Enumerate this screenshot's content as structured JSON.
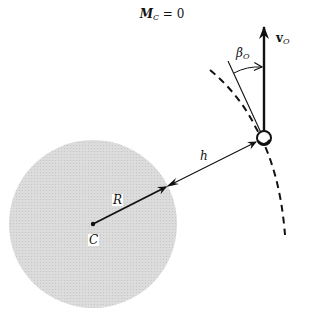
{
  "title": {
    "moment_symbol": "M",
    "moment_subscript": "C",
    "equation_rest": " = 0"
  },
  "labels": {
    "center": "C",
    "radius": "R",
    "altitude": "h",
    "velocity_symbol": "v",
    "velocity_subscript": "O",
    "angle_symbol": "β",
    "angle_subscript": "O"
  },
  "elements": {
    "planet": {
      "shape": "circle",
      "fill": "#d9d9d9",
      "cx": 93,
      "cy": 224,
      "r": 84
    },
    "satellite": {
      "shape": "small-circle",
      "cx": 264,
      "cy": 138,
      "r": 7
    },
    "trajectory": {
      "style": "dashed"
    },
    "velocity_vector": {
      "direction": "up"
    },
    "flight_path_angle": {
      "name": "beta_O"
    }
  },
  "colors": {
    "ink": "#111111",
    "planet_fill": "#d9d9d9",
    "background": "#ffffff"
  }
}
